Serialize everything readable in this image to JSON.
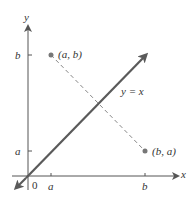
{
  "figure": {
    "axes": {
      "x_label": "x",
      "y_label": "y",
      "origin_label": "0"
    },
    "ticks": {
      "x": [
        {
          "label": "a"
        },
        {
          "label": "b"
        }
      ],
      "y": [
        {
          "label": "b"
        },
        {
          "label": "a"
        }
      ]
    },
    "line_label": "y = x",
    "points": [
      {
        "label": "(a, b)"
      },
      {
        "label": "(b, a)"
      }
    ],
    "colors": {
      "axis": "#555555",
      "line": "#5a5a5a",
      "dashed": "#888888",
      "point": "#777777",
      "text": "#333333"
    }
  }
}
